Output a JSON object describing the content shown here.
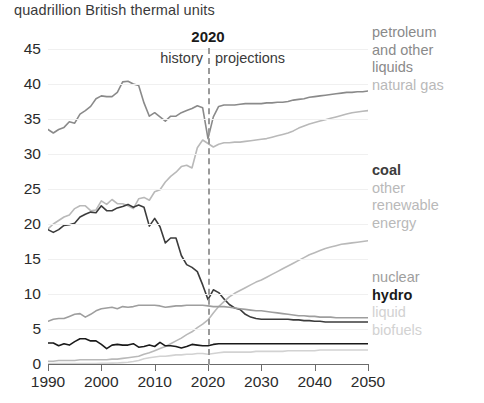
{
  "chart_title": "quadrillion British thermal units",
  "annotations": {
    "divider_year": "2020",
    "history_label": "history",
    "projections_label": "projections"
  },
  "legend": {
    "groups": [
      {
        "name": "upper",
        "entries": [
          {
            "key": "petroleum",
            "lines": [
              "petroleum",
              "and other",
              "liquids"
            ],
            "color": "#8a8a8a",
            "bold": false
          },
          {
            "key": "natural_gas",
            "lines": [
              "natural gas"
            ],
            "color": "#b9b9b9",
            "bold": false
          }
        ]
      },
      {
        "name": "middle",
        "entries": [
          {
            "key": "coal",
            "lines": [
              "coal"
            ],
            "color": "#3c3c3c",
            "bold": true
          },
          {
            "key": "other_renewable",
            "lines": [
              "other",
              "renewable",
              "energy"
            ],
            "color": "#b9b9b9",
            "bold": false
          }
        ]
      },
      {
        "name": "lower",
        "entries": [
          {
            "key": "nuclear",
            "lines": [
              "nuclear"
            ],
            "color": "#9e9e9e",
            "bold": false
          },
          {
            "key": "hydro",
            "lines": [
              "hydro"
            ],
            "color": "#1a1a1a",
            "bold": true
          },
          {
            "key": "liquid_biofuels",
            "lines": [
              "liquid",
              "biofuels"
            ],
            "color": "#d2d2d2",
            "bold": false
          }
        ]
      }
    ],
    "labels": {
      "petroleum_1": "petroleum",
      "petroleum_2": "and other",
      "petroleum_3": "liquids",
      "natural_gas": "natural gas",
      "coal": "coal",
      "renew_1": "other",
      "renew_2": "renewable",
      "renew_3": "energy",
      "nuclear": "nuclear",
      "hydro": "hydro",
      "biofuel_1": "liquid",
      "biofuel_2": "biofuels"
    }
  },
  "chart_data": {
    "type": "line",
    "title": "quadrillion British thermal units",
    "xlabel": "",
    "ylabel": "quadrillion British thermal units",
    "xlim": [
      1990,
      2050
    ],
    "ylim": [
      0,
      46
    ],
    "grid": true,
    "legend_position": "right",
    "xticks": [
      1990,
      2000,
      2010,
      2020,
      2030,
      2040,
      2050
    ],
    "yticks": [
      0,
      5,
      10,
      15,
      20,
      25,
      30,
      35,
      40,
      45
    ],
    "history_projection_split": 2020,
    "x": [
      1990,
      1991,
      1992,
      1993,
      1994,
      1995,
      1996,
      1997,
      1998,
      1999,
      2000,
      2001,
      2002,
      2003,
      2004,
      2005,
      2006,
      2007,
      2008,
      2009,
      2010,
      2011,
      2012,
      2013,
      2014,
      2015,
      2016,
      2017,
      2018,
      2019,
      2020,
      2021,
      2022,
      2023,
      2024,
      2025,
      2026,
      2027,
      2028,
      2029,
      2030,
      2031,
      2032,
      2033,
      2034,
      2035,
      2036,
      2037,
      2038,
      2039,
      2040,
      2041,
      2042,
      2043,
      2044,
      2045,
      2046,
      2047,
      2048,
      2049,
      2050
    ],
    "series": [
      {
        "name": "petroleum and other liquids",
        "color": "#8a8a8a",
        "values": [
          33.5,
          33.0,
          33.5,
          33.8,
          34.6,
          34.4,
          35.7,
          36.2,
          36.8,
          37.9,
          38.3,
          38.2,
          38.2,
          38.8,
          40.3,
          40.4,
          40.0,
          39.8,
          37.3,
          35.4,
          35.9,
          35.3,
          34.7,
          35.4,
          35.4,
          35.9,
          36.2,
          36.5,
          36.9,
          36.6,
          32.2,
          35.3,
          36.8,
          37.0,
          37.0,
          37.0,
          37.1,
          37.2,
          37.2,
          37.2,
          37.2,
          37.3,
          37.3,
          37.4,
          37.4,
          37.5,
          37.7,
          37.8,
          37.9,
          38.1,
          38.2,
          38.3,
          38.4,
          38.5,
          38.6,
          38.7,
          38.8,
          38.8,
          38.9,
          38.9,
          39.0
        ]
      },
      {
        "name": "natural gas",
        "color": "#b9b9b9",
        "values": [
          19.3,
          20.0,
          20.5,
          21.0,
          21.3,
          22.2,
          22.6,
          22.6,
          21.9,
          22.0,
          23.3,
          22.8,
          23.5,
          22.9,
          22.9,
          22.6,
          22.2,
          23.6,
          23.8,
          23.4,
          24.6,
          24.9,
          26.0,
          26.8,
          27.4,
          28.2,
          28.4,
          28.0,
          30.9,
          32.0,
          31.5,
          31.0,
          31.4,
          31.6,
          31.6,
          31.7,
          31.7,
          31.8,
          31.9,
          32.0,
          32.1,
          32.2,
          32.4,
          32.6,
          32.8,
          33.0,
          33.3,
          33.7,
          34.0,
          34.3,
          34.5,
          34.7,
          34.9,
          35.1,
          35.3,
          35.5,
          35.7,
          35.9,
          36.0,
          36.1,
          36.2
        ]
      },
      {
        "name": "coal",
        "color": "#3c3c3c",
        "values": [
          19.2,
          18.8,
          19.2,
          19.8,
          19.9,
          20.1,
          21.0,
          21.4,
          21.7,
          21.6,
          22.6,
          21.9,
          21.9,
          22.3,
          22.5,
          22.8,
          22.4,
          22.7,
          22.4,
          19.7,
          20.8,
          19.6,
          17.3,
          18.0,
          18.0,
          15.5,
          14.2,
          13.8,
          13.2,
          11.3,
          9.2,
          10.6,
          10.2,
          9.3,
          8.5,
          8.0,
          7.8,
          7.1,
          6.7,
          6.5,
          6.4,
          6.4,
          6.4,
          6.4,
          6.4,
          6.4,
          6.3,
          6.3,
          6.2,
          6.2,
          6.1,
          6.1,
          6.0,
          6.0,
          6.0,
          6.0,
          6.0,
          6.0,
          6.0,
          6.0,
          6.0
        ]
      },
      {
        "name": "other renewable energy",
        "color": "#b9b9b9",
        "values": [
          0.4,
          0.4,
          0.5,
          0.5,
          0.5,
          0.5,
          0.6,
          0.6,
          0.6,
          0.6,
          0.6,
          0.6,
          0.7,
          0.7,
          0.8,
          0.9,
          1.0,
          1.1,
          1.4,
          1.6,
          1.9,
          2.2,
          2.5,
          2.9,
          3.3,
          3.7,
          4.2,
          4.6,
          5.2,
          5.7,
          6.3,
          7.3,
          8.2,
          8.9,
          9.6,
          10.1,
          10.5,
          10.9,
          11.3,
          11.7,
          12.0,
          12.4,
          12.8,
          13.2,
          13.6,
          14.0,
          14.4,
          14.8,
          15.2,
          15.6,
          15.9,
          16.2,
          16.5,
          16.7,
          16.9,
          17.1,
          17.2,
          17.3,
          17.4,
          17.5,
          17.6
        ]
      },
      {
        "name": "nuclear",
        "color": "#9e9e9e",
        "values": [
          6.1,
          6.4,
          6.5,
          6.5,
          6.8,
          7.1,
          7.2,
          6.7,
          7.1,
          7.6,
          7.9,
          8.0,
          8.1,
          7.9,
          8.2,
          8.1,
          8.2,
          8.4,
          8.4,
          8.4,
          8.4,
          8.3,
          8.1,
          8.2,
          8.3,
          8.3,
          8.4,
          8.4,
          8.4,
          8.4,
          8.3,
          8.2,
          8.2,
          8.2,
          8.1,
          8.0,
          7.9,
          7.8,
          7.7,
          7.6,
          7.6,
          7.5,
          7.4,
          7.3,
          7.2,
          7.1,
          7.0,
          6.9,
          6.9,
          6.8,
          6.8,
          6.7,
          6.7,
          6.7,
          6.6,
          6.6,
          6.6,
          6.6,
          6.6,
          6.6,
          6.6
        ]
      },
      {
        "name": "hydro",
        "color": "#1a1a1a",
        "values": [
          3.0,
          3.0,
          2.6,
          2.9,
          2.7,
          3.2,
          3.6,
          3.6,
          3.3,
          3.3,
          2.8,
          2.2,
          2.7,
          2.8,
          2.7,
          2.7,
          2.9,
          2.4,
          2.5,
          2.7,
          2.5,
          3.1,
          2.6,
          2.6,
          2.5,
          2.3,
          2.5,
          2.8,
          2.7,
          2.6,
          2.6,
          2.8,
          2.9,
          2.9,
          2.9,
          2.9,
          2.9,
          2.9,
          2.9,
          2.9,
          2.9,
          2.9,
          2.9,
          2.9,
          2.9,
          2.9,
          2.9,
          2.9,
          2.9,
          2.9,
          2.9,
          2.9,
          2.9,
          2.9,
          2.9,
          2.9,
          2.9,
          2.9,
          2.9,
          2.9,
          2.9
        ]
      },
      {
        "name": "liquid biofuels",
        "color": "#d2d2d2",
        "values": [
          0.05,
          0.05,
          0.05,
          0.05,
          0.06,
          0.07,
          0.06,
          0.07,
          0.07,
          0.08,
          0.09,
          0.1,
          0.12,
          0.15,
          0.2,
          0.25,
          0.35,
          0.5,
          0.75,
          0.9,
          1.0,
          1.1,
          1.1,
          1.2,
          1.3,
          1.3,
          1.4,
          1.4,
          1.5,
          1.5,
          1.4,
          1.5,
          1.6,
          1.7,
          1.7,
          1.7,
          1.7,
          1.7,
          1.7,
          1.8,
          1.8,
          1.8,
          1.8,
          1.8,
          1.8,
          1.9,
          1.9,
          1.9,
          1.9,
          1.9,
          1.9,
          2.0,
          2.0,
          2.0,
          2.0,
          2.0,
          2.0,
          2.0,
          2.0,
          2.0,
          2.0
        ]
      }
    ]
  }
}
